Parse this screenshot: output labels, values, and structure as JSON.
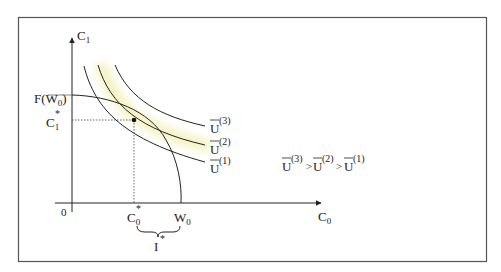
{
  "figure": {
    "frame_color": "#555555",
    "line_color": "#222222",
    "highlight_color": "#f6f3c8",
    "axes": {
      "x_label": "C",
      "x_label_sub": "0",
      "y_label": "C",
      "y_label_sub": "1",
      "origin": "0"
    },
    "labels": {
      "f_w0": "F(W",
      "f_w0_sub": "0",
      "f_w0_close": ")",
      "c1_star": "C",
      "c1_star_sub": "1",
      "c1_star_sup": "*",
      "c0_star": "C",
      "c0_star_sub": "0",
      "c0_star_sup": "*",
      "w0": "W",
      "w0_sub": "0",
      "i_star": "I",
      "i_star_sup": "*"
    },
    "curves": [
      {
        "name": "U",
        "sup": "(3)"
      },
      {
        "name": "U",
        "sup": "(2)"
      },
      {
        "name": "U",
        "sup": "(1)"
      }
    ],
    "ordering": {
      "u3": "U",
      "u3_sup": "(3)",
      "gt1": ">",
      "u2": "U",
      "u2_sup": "(2)",
      "gt2": ">",
      "u1": "U",
      "u1_sup": "(1)"
    }
  }
}
